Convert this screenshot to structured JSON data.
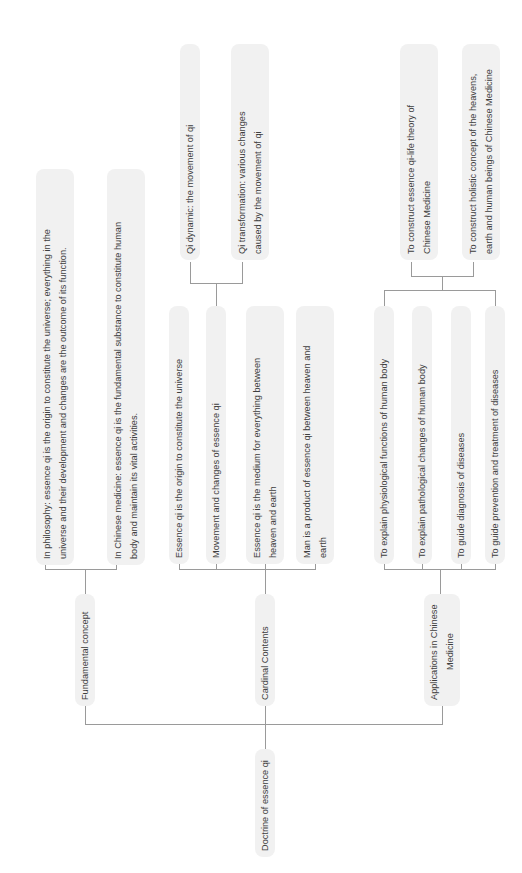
{
  "diagram": {
    "root": {
      "label": "Doctrine of essence qi"
    },
    "branches": [
      {
        "label": "Fundamental concept",
        "children": [
          {
            "lines": [
              "In philosophy: essence qi is the origin to constitute the universe; everything in the",
              "universe and their development and changes are the outcome of its function."
            ]
          },
          {
            "lines": [
              "In Chinese medicine: essence qi is the fundamental substance to constitute human",
              "body and maintain its vital activities."
            ]
          }
        ]
      },
      {
        "label": "Cardinal Contents",
        "children": [
          {
            "lines": [
              "Essence qi is the origin to constitute the universe"
            ]
          },
          {
            "lines": [
              "Movement and changes of essence qi"
            ],
            "children": [
              {
                "lines": [
                  "Qi dynamic: the movement of qi"
                ]
              },
              {
                "lines": [
                  "Qi transformation: various changes",
                  "caused by the movement of qi"
                ]
              }
            ]
          },
          {
            "lines": [
              "Essence qi is the medium for everything between",
              "heaven and earth"
            ]
          },
          {
            "lines": [
              "Man is a product of essence qi between heaven and",
              "earth"
            ]
          }
        ]
      },
      {
        "label_lines": [
          "Applications in Chinese",
          "Medicine"
        ],
        "children": [
          {
            "lines": [
              "To explain physiological functions of human body"
            ]
          },
          {
            "lines": [
              "To explain pathological changes of human body"
            ]
          },
          {
            "lines": [
              "To guide diagnosis of diseases"
            ]
          },
          {
            "lines": [
              "To guide prevention and treatment of diseases"
            ]
          }
        ],
        "top_children": [
          {
            "lines": [
              "To construct essence qi-life theory of",
              "Chinese Medicine"
            ]
          },
          {
            "lines": [
              "To construct holistic concept of the heavens,",
              "earth and human beings of Chinese Medicine"
            ]
          }
        ]
      }
    ],
    "colors": {
      "node_fill": "#f1f1f1",
      "text": "#3e3e3e",
      "connector": "#9a9a9a"
    }
  }
}
